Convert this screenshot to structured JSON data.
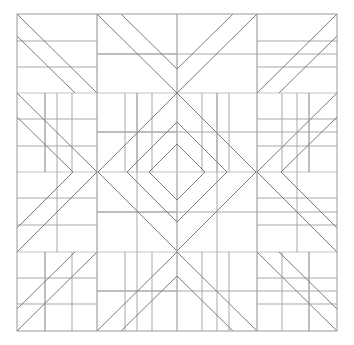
{
  "figure": {
    "kind": "geometric-tessellation",
    "canvas": {
      "width": 354,
      "height": 345,
      "background": "#ffffff"
    }
  },
  "colors": {
    "background": "#ffffff",
    "frame": "#9a9a9a",
    "grid_major": "#8e8e8e",
    "grid_minor": "#a9a9a9",
    "grid_light": "#c4c4c4",
    "diagonal": "#7d7d7d",
    "diamond": "#7d7d7d"
  },
  "geometry": {
    "frame": {
      "x0": 17,
      "y0": 14,
      "x1": 337,
      "y1": 331
    },
    "major_x": [
      17,
      97,
      177,
      257,
      337
    ],
    "major_y": [
      14,
      93,
      172,
      252,
      331
    ],
    "band_mid_x": 177,
    "band_mid_y": 172,
    "block_width": 80,
    "block_height": 79.25,
    "corner_diagonal_offsets": [
      0,
      22
    ],
    "chevron_offsets": [
      0,
      24
    ],
    "diamond_half_spans": [
      79,
      50,
      28
    ],
    "stroke_width": 1
  },
  "motifs": {
    "corner_top_left": "nested-double-diagonal-descending",
    "corner_top_right": "nested-double-diagonal-ascending",
    "corner_bottom_left": "nested-double-diagonal-descending",
    "corner_bottom_right": "nested-double-diagonal-ascending",
    "edge_top": "nested-double-chevron-down",
    "edge_bottom": "nested-double-chevron-up",
    "edge_left": "nested-double-chevron-right",
    "edge_right": "nested-double-chevron-left",
    "center": "nested-diamonds-three-levels"
  },
  "subdivisions": {
    "top_band_ticks_x": [
      45,
      72,
      125,
      152,
      202,
      229,
      282,
      309
    ],
    "inner_band_ticks_x": [
      45,
      72,
      125,
      152,
      202,
      229,
      282,
      309
    ],
    "left_band_ticks_y": [
      41,
      67,
      119,
      146,
      198,
      225,
      278,
      304
    ],
    "cell_divider_y_top": [
      54,
      132
    ],
    "cell_divider_y_bottom": [
      212,
      291
    ],
    "horizontal_mid_rules": [
      54,
      132,
      212,
      291
    ],
    "vertical_mid_rules": [
      57,
      137,
      217,
      297
    ]
  },
  "labels": {
    "none": ""
  }
}
